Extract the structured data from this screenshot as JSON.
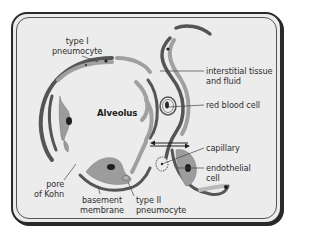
{
  "diagram": {
    "title": "Alveolus",
    "colors": {
      "background": "#ececec",
      "frame": "#2a2a2a",
      "wall_dark": "#555555",
      "cell_grey": "#9c9c9c",
      "cell_light": "#b8b8b8",
      "nucleus": "#1e1e1e",
      "text": "#2f2f2f"
    },
    "labels": {
      "type1_line1": "type I",
      "type1_line2": "pneumocyte",
      "interstitial_line1": "interstitial tissue",
      "interstitial_line2": "and fluid",
      "rbc": "red blood cell",
      "alveolus": "Alveolus",
      "capillary": "capillary",
      "endothelial_line1": "endothelial",
      "endothelial_line2": "cell",
      "pore_line1": "pore",
      "pore_line2": "of Kohn",
      "basement_line1": "basement",
      "basement_line2": "membrane",
      "type2_line1": "type II",
      "type2_line2": "pneumocyte"
    }
  }
}
